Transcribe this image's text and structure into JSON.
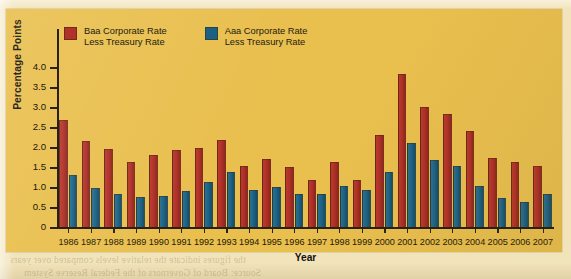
{
  "chart_data": {
    "type": "bar",
    "title": "",
    "xlabel": "Year",
    "ylabel": "Percentage Points",
    "ylim": [
      0,
      4.0
    ],
    "yticks": [
      "0",
      "0.5",
      "1.0",
      "1.5",
      "2.0",
      "2.5",
      "3.0",
      "3.5",
      "4.0"
    ],
    "ytick_values": [
      0,
      0.5,
      1.0,
      1.5,
      2.0,
      2.5,
      3.0,
      3.5,
      4.0
    ],
    "grid": false,
    "legend_position": "top-left",
    "categories": [
      "1986",
      "1987",
      "1988",
      "1989",
      "1990",
      "1991",
      "1992",
      "1993",
      "1994",
      "1995",
      "1996",
      "1997",
      "1998",
      "1999",
      "2000",
      "2001",
      "2002",
      "2003",
      "2004",
      "2005",
      "2006",
      "2007"
    ],
    "series": [
      {
        "name": "Baa Corporate Rate Less Treasury Rate",
        "color": "#b0322a",
        "values": [
          2.7,
          2.18,
          1.98,
          1.66,
          1.83,
          1.95,
          2.0,
          2.19,
          1.56,
          1.73,
          1.53,
          1.2,
          1.66,
          1.2,
          2.32,
          3.84,
          3.03,
          2.86,
          2.43,
          1.75,
          1.65,
          1.56
        ]
      },
      {
        "name": "Aaa Corporate Rate Less Treasury Rate",
        "color": "#1a6183",
        "values": [
          1.33,
          1.0,
          0.86,
          0.77,
          0.79,
          0.93,
          1.15,
          1.41,
          0.95,
          1.03,
          0.84,
          0.86,
          1.04,
          0.94,
          1.39,
          2.12,
          1.7,
          1.56,
          1.05,
          0.75,
          0.65,
          0.85
        ]
      }
    ]
  },
  "legend": {
    "entries": [
      {
        "label_line1": "Baa Corporate Rate",
        "label_line2": "Less Treasury Rate",
        "swatch": "baa"
      },
      {
        "label_line1": "Aaa Corporate Rate",
        "label_line2": "Less Treasury Rate",
        "swatch": "aaa"
      }
    ]
  },
  "page": {
    "background_color": "#f1e3ba",
    "chart_background_color": "#e9bf4e",
    "bleed_lines": [
      "the spirit to employ  during consumers  poor  with pull  the",
      "deadly  through  the  levels  remain  constant  as  it  is  beyond",
      "then  raise  profit  inflation  of  the  net  deflation  in  the  economy"
    ]
  }
}
